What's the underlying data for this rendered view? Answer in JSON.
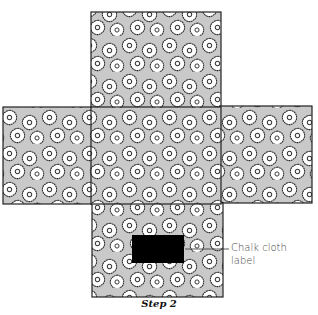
{
  "figure": {
    "caption": "Step 2",
    "callout": {
      "line1": "Chalk cloth",
      "line2": "label"
    },
    "colors": {
      "fabric_background": "#c9c9c9",
      "flower_fill": "#ffffff",
      "outline": "#222222",
      "label_fill": "#000000"
    },
    "panels": [
      {
        "name": "top",
        "x": 91,
        "y": 12,
        "w": 130,
        "h": 96
      },
      {
        "name": "left",
        "x": 3,
        "y": 107,
        "w": 89,
        "h": 97
      },
      {
        "name": "center",
        "x": 91,
        "y": 107,
        "w": 130,
        "h": 97
      },
      {
        "name": "right",
        "x": 220,
        "y": 106,
        "w": 92,
        "h": 97
      },
      {
        "name": "bottom",
        "x": 92,
        "y": 203,
        "w": 131,
        "h": 94
      }
    ],
    "label_rect": {
      "x": 132,
      "y": 235,
      "w": 52,
      "h": 28
    },
    "leader_line": {
      "x1": 185,
      "y1": 249,
      "x2": 229,
      "y2": 249
    }
  }
}
